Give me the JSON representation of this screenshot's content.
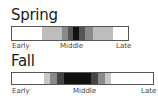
{
  "chart_data": [
    {
      "type": "heatmap",
      "title": "Spring",
      "xlabels": [
        "Early",
        "Middle",
        "Late"
      ],
      "segments": [
        {
          "from": 0.0,
          "to": 0.26,
          "color": "#ffffff"
        },
        {
          "from": 0.26,
          "to": 0.43,
          "color": "#bdbdbd"
        },
        {
          "from": 0.43,
          "to": 0.48,
          "color": "#8a8a8a"
        },
        {
          "from": 0.48,
          "to": 0.53,
          "color": "#555555"
        },
        {
          "from": 0.53,
          "to": 0.58,
          "color": "#111111"
        },
        {
          "from": 0.58,
          "to": 0.63,
          "color": "#555555"
        },
        {
          "from": 0.63,
          "to": 0.7,
          "color": "#8a8a8a"
        },
        {
          "from": 0.7,
          "to": 0.87,
          "color": "#bdbdbd"
        },
        {
          "from": 0.87,
          "to": 1.0,
          "color": "#ffffff"
        }
      ]
    },
    {
      "type": "heatmap",
      "title": "Fall",
      "xlabels": [
        "Early",
        "Middle",
        "Late"
      ],
      "segments": [
        {
          "from": 0.0,
          "to": 0.23,
          "color": "#ffffff"
        },
        {
          "from": 0.23,
          "to": 0.27,
          "color": "#c8c8c8"
        },
        {
          "from": 0.27,
          "to": 0.32,
          "color": "#8a8a8a"
        },
        {
          "from": 0.32,
          "to": 0.37,
          "color": "#444444"
        },
        {
          "from": 0.37,
          "to": 0.56,
          "color": "#111111"
        },
        {
          "from": 0.56,
          "to": 0.61,
          "color": "#444444"
        },
        {
          "from": 0.61,
          "to": 0.66,
          "color": "#8a8a8a"
        },
        {
          "from": 0.66,
          "to": 0.7,
          "color": "#c8c8c8"
        },
        {
          "from": 0.7,
          "to": 1.0,
          "color": "#ffffff"
        }
      ]
    }
  ],
  "spring": {
    "title": "Spring",
    "early": "Early",
    "middle": "Middle",
    "late": "Late"
  },
  "fall": {
    "title": "Fall",
    "early": "Early",
    "middle": "Middle",
    "late": "Late"
  }
}
